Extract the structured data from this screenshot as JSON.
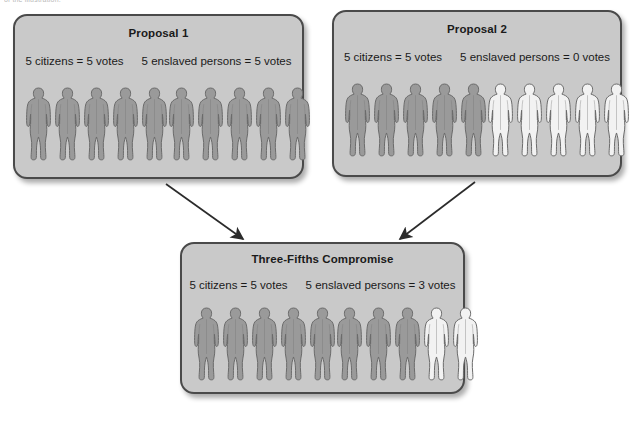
{
  "page": {
    "clipped_top_caption": "of the illustration.",
    "background_color": "#ffffff"
  },
  "style": {
    "panel_fill": "#c9c9c9",
    "panel_border": "#4a4a4a",
    "figure_filled_color": "#9a9a9a",
    "figure_outline_color": "#f2f2f2",
    "figure_stroke": "#6a6a6a",
    "text_color": "#1a1a1a",
    "arrow_color": "#2b2b2b"
  },
  "panels": [
    {
      "id": "proposal-1",
      "title": "Proposal 1",
      "caption_left": "5 citizens = 5 votes",
      "caption_right": "5 enslaved persons = 5 votes",
      "left_group": {
        "label": "citizens",
        "total": 5,
        "filled": 5
      },
      "right_group": {
        "label": "enslaved persons",
        "total": 5,
        "filled": 5
      }
    },
    {
      "id": "proposal-2",
      "title": "Proposal 2",
      "caption_left": "5 citizens = 5 votes",
      "caption_right": "5 enslaved persons = 0 votes",
      "left_group": {
        "label": "citizens",
        "total": 5,
        "filled": 5
      },
      "right_group": {
        "label": "enslaved persons",
        "total": 5,
        "filled": 0
      }
    },
    {
      "id": "three-fifths-compromise",
      "title": "Three-Fifths Compromise",
      "caption_left": "5 citizens = 5 votes",
      "caption_right": "5 enslaved persons = 3 votes",
      "left_group": {
        "label": "citizens",
        "total": 5,
        "filled": 5
      },
      "right_group": {
        "label": "enslaved persons",
        "total": 5,
        "filled": 3
      }
    }
  ],
  "arrows": [
    {
      "id": "arrow-proposal1-to-compromise",
      "from": "proposal-1",
      "to": "three-fifths-compromise"
    },
    {
      "id": "arrow-proposal2-to-compromise",
      "from": "proposal-2",
      "to": "three-fifths-compromise"
    }
  ],
  "chart_data": {
    "type": "diagram",
    "series": [
      {
        "name": "Proposal 1",
        "citizens_people": 5,
        "citizens_votes": 5,
        "enslaved_people": 5,
        "enslaved_votes": 5
      },
      {
        "name": "Proposal 2",
        "citizens_people": 5,
        "citizens_votes": 5,
        "enslaved_people": 5,
        "enslaved_votes": 0
      },
      {
        "name": "Three-Fifths Compromise",
        "citizens_people": 5,
        "citizens_votes": 5,
        "enslaved_people": 5,
        "enslaved_votes": 3
      }
    ]
  }
}
